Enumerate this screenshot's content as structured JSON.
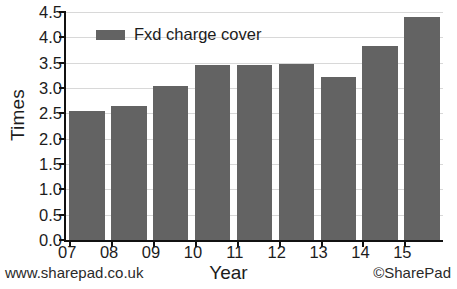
{
  "chart_data": {
    "type": "bar",
    "title": "",
    "xlabel": "Year",
    "ylabel": "Times",
    "categories": [
      "07",
      "08",
      "09",
      "10",
      "11",
      "12",
      "13",
      "14",
      "15"
    ],
    "values": [
      2.55,
      2.65,
      3.03,
      3.45,
      3.45,
      3.48,
      3.21,
      3.82,
      4.4
    ],
    "series": [
      {
        "name": "Fxd charge cover",
        "values": [
          2.55,
          2.65,
          3.03,
          3.45,
          3.45,
          3.48,
          3.21,
          3.82,
          4.4
        ],
        "color": "#636363"
      }
    ],
    "ylim": [
      0.0,
      4.5
    ],
    "ytick_values": [
      0.0,
      0.5,
      1.0,
      1.5,
      2.0,
      2.5,
      3.0,
      3.5,
      4.0,
      4.5
    ],
    "ytick_labels": [
      "0.0",
      "0.5",
      "1.0",
      "1.5",
      "2.0",
      "2.5",
      "3.0",
      "3.5",
      "4.0",
      "4.5"
    ],
    "grid": true,
    "legend_position": "top-left-inside",
    "bar_color": "#636363",
    "axis_color": "#111111",
    "gridline_color": "#d8d8d8"
  },
  "legend": {
    "entries": [
      {
        "label": "Fxd charge cover",
        "color": "#636363"
      }
    ]
  },
  "footer": {
    "website": "www.sharepad.co.uk",
    "copyright": "©SharePad"
  }
}
